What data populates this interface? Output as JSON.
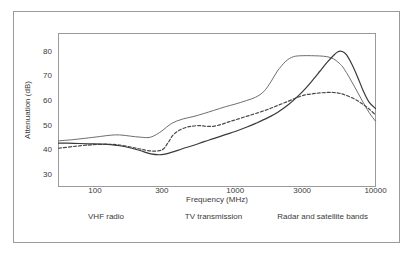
{
  "chart_data": {
    "type": "line",
    "title": "",
    "xlabel": "Frequency (MHz)",
    "ylabel": "Attenuation (dB)",
    "x_scale": "log",
    "xlim": [
      55,
      10000
    ],
    "ylim": [
      25,
      87
    ],
    "grid": false,
    "legend": "none",
    "x_ticks": [
      100,
      300,
      1000,
      3000,
      10000
    ],
    "x_tick_labels": [
      "100",
      "300",
      "1000",
      "3000",
      "10000"
    ],
    "y_ticks": [
      30,
      40,
      50,
      60,
      70,
      80
    ],
    "y_tick_labels": [
      "30",
      "40",
      "50",
      "60",
      "70",
      "80"
    ],
    "annotations": [
      {
        "text": "VHF radio",
        "x": 120
      },
      {
        "text": "TV transmission",
        "x": 700
      },
      {
        "text": "Radar and satellite bands",
        "x": 4200
      }
    ],
    "series": [
      {
        "name": "upper-curve",
        "style": "solid",
        "color": "#6e6e6e",
        "width": 1,
        "x": [
          55,
          70,
          90,
          110,
          130,
          150,
          180,
          210,
          250,
          300,
          350,
          420,
          500,
          600,
          700,
          850,
          1000,
          1200,
          1400,
          1600,
          1800,
          2000,
          2300,
          2600,
          3000,
          3500,
          4000,
          4500,
          5000,
          5500,
          6000,
          7000,
          8000,
          9000,
          10000
        ],
        "y": [
          43.5,
          44.0,
          44.7,
          45.3,
          45.8,
          45.9,
          45.4,
          45.0,
          45.0,
          47.5,
          50.5,
          52.3,
          53.3,
          54.6,
          55.8,
          57.3,
          58.4,
          59.8,
          61.2,
          63.5,
          67.5,
          71.8,
          75.8,
          77.6,
          78.0,
          78.0,
          77.9,
          77.6,
          76.8,
          75.0,
          72.5,
          66.0,
          60.0,
          55.0,
          51.5
        ]
      },
      {
        "name": "middle-dashed-curve",
        "style": "dashed",
        "color": "#4a4a4a",
        "width": 1.2,
        "x": [
          55,
          70,
          90,
          110,
          130,
          150,
          180,
          210,
          250,
          300,
          330,
          360,
          400,
          450,
          500,
          560,
          620,
          700,
          800,
          900,
          1000,
          1200,
          1400,
          1700,
          2000,
          2400,
          2800,
          3200,
          3600,
          4000,
          4500,
          5000,
          5500,
          6000,
          7000,
          8000,
          9000,
          10000
        ],
        "y": [
          40.5,
          41.2,
          41.8,
          42.1,
          42.1,
          41.8,
          41.0,
          40.2,
          39.4,
          39.8,
          42.5,
          45.8,
          47.8,
          49.0,
          49.5,
          49.7,
          49.4,
          49.4,
          50.2,
          51.2,
          52.0,
          53.4,
          54.6,
          56.2,
          57.8,
          59.6,
          61.2,
          62.2,
          62.6,
          62.9,
          63.1,
          63.1,
          62.8,
          62.2,
          60.6,
          58.6,
          56.4,
          54.0
        ]
      },
      {
        "name": "lower-rising-curve",
        "style": "solid",
        "color": "#3a3a3a",
        "width": 1.2,
        "x": [
          55,
          70,
          90,
          110,
          130,
          150,
          180,
          210,
          250,
          300,
          350,
          420,
          500,
          600,
          700,
          850,
          1000,
          1200,
          1400,
          1700,
          2000,
          2400,
          2800,
          3200,
          3600,
          4000,
          4500,
          5000,
          5400,
          5800,
          6200,
          6800,
          7500,
          8200,
          9000,
          10000
        ],
        "y": [
          42.6,
          42.5,
          42.3,
          42.2,
          42.0,
          41.5,
          40.6,
          39.6,
          38.2,
          37.9,
          38.8,
          40.3,
          41.6,
          43.2,
          44.4,
          46.0,
          47.3,
          49.0,
          50.6,
          52.8,
          55.0,
          58.2,
          61.6,
          65.0,
          68.4,
          71.6,
          75.2,
          78.0,
          79.6,
          79.7,
          78.4,
          74.4,
          69.0,
          63.6,
          59.2,
          56.6
        ]
      }
    ]
  }
}
